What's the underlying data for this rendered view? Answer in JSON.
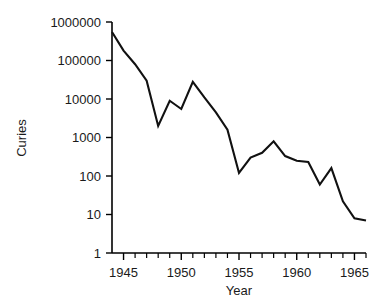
{
  "chart_data": {
    "type": "line",
    "title": "",
    "xlabel": "Year",
    "ylabel": "Curies",
    "xlim": [
      1944,
      1966
    ],
    "ylim": [
      1,
      1000000
    ],
    "yscale": "log",
    "grid": false,
    "legend": null,
    "xticks": [
      1945,
      1950,
      1955,
      1960,
      1965
    ],
    "xtick_labels": [
      "1945",
      "1950",
      "1955",
      "1960",
      "1965"
    ],
    "xtick_minor_step": 1,
    "yticks": [
      1,
      10,
      100,
      1000,
      10000,
      100000,
      1000000
    ],
    "ytick_labels": [
      "1",
      "10",
      "100",
      "1000",
      "10000",
      "100000",
      "1000000"
    ],
    "series": [
      {
        "name": "Curies",
        "color": "#111111",
        "x": [
          1944,
          1945,
          1946,
          1947,
          1948,
          1949,
          1950,
          1951,
          1952,
          1953,
          1954,
          1955,
          1956,
          1957,
          1958,
          1959,
          1960,
          1961,
          1962,
          1963,
          1964,
          1965,
          1966
        ],
        "values": [
          550000,
          180000,
          80000,
          30000,
          2000,
          9000,
          5500,
          28000,
          11000,
          4500,
          1600,
          120,
          300,
          400,
          800,
          330,
          250,
          230,
          60,
          160,
          22,
          8,
          7
        ]
      }
    ]
  },
  "axes": {
    "y_axis_title": "Curies",
    "x_axis_title": "Year"
  }
}
